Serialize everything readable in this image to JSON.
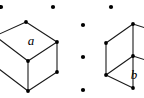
{
  "figure": {
    "canvas": {
      "width": 144,
      "height": 98,
      "background": "#ffffff"
    },
    "stroke_color": "#1a1a1a",
    "vertex_color": "#000000",
    "label_color": "#000000",
    "shapes": [
      {
        "id": "left-cube",
        "name": "cube",
        "label": "a",
        "label_position": {
          "x": 31,
          "y": 45
        },
        "label_font_size": 13,
        "description": "Isometric cube, left vertex clipped by canvas edge",
        "vertices": {
          "top": {
            "x": 26,
            "y": 22
          },
          "left": {
            "x": -5,
            "y": 36
          },
          "right": {
            "x": 57,
            "y": 42
          },
          "center_front": {
            "x": 28,
            "y": 61
          },
          "bottom_left": {
            "x": -5,
            "y": 66
          },
          "bottom_right": {
            "x": 57,
            "y": 72
          },
          "bottom": {
            "x": 28,
            "y": 91
          }
        },
        "visible_vertex_dots": [
          {
            "x": 26,
            "y": 22
          },
          {
            "x": 57,
            "y": 42
          },
          {
            "x": 28,
            "y": 61
          },
          {
            "x": 57,
            "y": 72
          },
          {
            "x": 28,
            "y": 91
          }
        ]
      },
      {
        "id": "right-parallelepiped",
        "name": "parallelepiped",
        "label": "b",
        "label_position": {
          "x": 134,
          "y": 79
        },
        "label_font_size": 13,
        "description": "Sheared box / parallelepiped, right side clipped by canvas edge",
        "vertices": {
          "top_right": {
            "x": 133,
            "y": 24
          },
          "top_left": {
            "x": 106,
            "y": 43
          },
          "mid_left": {
            "x": 106,
            "y": 75
          },
          "mid_right": {
            "x": 133,
            "y": 56
          },
          "bottom_right": {
            "x": 133,
            "y": 88
          },
          "far_right_top": {
            "x": 152,
            "y": 30
          },
          "far_right_mid": {
            "x": 152,
            "y": 62
          }
        },
        "visible_vertex_dots": [
          {
            "x": 133,
            "y": 24
          },
          {
            "x": 106,
            "y": 43
          },
          {
            "x": 106,
            "y": 75
          },
          {
            "x": 133,
            "y": 56
          },
          {
            "x": 133,
            "y": 88
          }
        ]
      }
    ],
    "separator_dots": {
      "name": "ellipsis-dots",
      "radius": 2.1,
      "color": "#000000",
      "top_row": [
        {
          "x": 1,
          "y": 7
        },
        {
          "x": 53,
          "y": 7
        },
        {
          "x": 111,
          "y": 7
        }
      ],
      "middle_column": [
        {
          "x": 83,
          "y": 25
        },
        {
          "x": 83,
          "y": 57
        },
        {
          "x": 83,
          "y": 90
        }
      ]
    }
  }
}
